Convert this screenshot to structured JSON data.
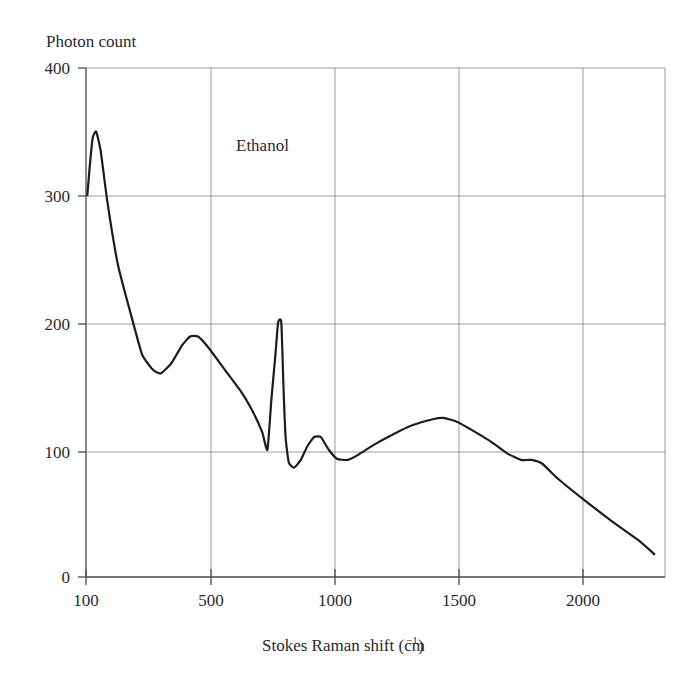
{
  "chart_data": {
    "type": "line",
    "title": "",
    "annotation": "Ethanol",
    "xlabel_text": "Stokes Raman shift (cm",
    "xlabel_sup": "−1",
    "xlabel_tail": ")",
    "xlabel": "Stokes Raman shift (cm⁻¹)",
    "ylabel": "Photon count",
    "xlim": [
      80,
      2250
    ],
    "ylim": [
      0,
      400
    ],
    "xticks": [
      100,
      500,
      1000,
      1500,
      2000
    ],
    "xticklabels": [
      "100",
      "500",
      "1000",
      "1500",
      "2000"
    ],
    "yticks": [
      0,
      100,
      200,
      300,
      400
    ],
    "yticklabels": [
      "0",
      "100",
      "200",
      "300",
      "400"
    ],
    "grid": true,
    "legend": "none",
    "line_color": "#1c1c1c",
    "grid_color": "#9a9a9a",
    "axis_color": "#4a4a4a",
    "series": [
      {
        "name": "Ethanol Raman spectrum",
        "points": [
          [
            85,
            300
          ],
          [
            95,
            325
          ],
          [
            105,
            345
          ],
          [
            118,
            350
          ],
          [
            135,
            335
          ],
          [
            160,
            295
          ],
          [
            200,
            245
          ],
          [
            250,
            205
          ],
          [
            290,
            175
          ],
          [
            330,
            163
          ],
          [
            360,
            160
          ],
          [
            400,
            168
          ],
          [
            440,
            182
          ],
          [
            470,
            189
          ],
          [
            500,
            189
          ],
          [
            540,
            180
          ],
          [
            600,
            163
          ],
          [
            660,
            146
          ],
          [
            700,
            132
          ],
          [
            740,
            114
          ],
          [
            760,
            100
          ],
          [
            775,
            140
          ],
          [
            790,
            175
          ],
          [
            800,
            200
          ],
          [
            812,
            200
          ],
          [
            820,
            150
          ],
          [
            828,
            110
          ],
          [
            840,
            90
          ],
          [
            860,
            86
          ],
          [
            885,
            92
          ],
          [
            910,
            103
          ],
          [
            935,
            110
          ],
          [
            960,
            110
          ],
          [
            990,
            100
          ],
          [
            1020,
            93
          ],
          [
            1060,
            92
          ],
          [
            1100,
            96
          ],
          [
            1160,
            104
          ],
          [
            1230,
            112
          ],
          [
            1300,
            119
          ],
          [
            1380,
            124
          ],
          [
            1420,
            125
          ],
          [
            1470,
            122
          ],
          [
            1530,
            115
          ],
          [
            1600,
            106
          ],
          [
            1660,
            97
          ],
          [
            1710,
            92
          ],
          [
            1750,
            92
          ],
          [
            1790,
            89
          ],
          [
            1850,
            77
          ],
          [
            1950,
            60
          ],
          [
            2050,
            44
          ],
          [
            2150,
            29
          ],
          [
            2210,
            18
          ]
        ]
      }
    ]
  },
  "axes": {
    "y_title": "Photon count",
    "x_title_main": "Stokes Raman shift (cm",
    "x_title_sup": "−1",
    "x_title_close": ")"
  }
}
